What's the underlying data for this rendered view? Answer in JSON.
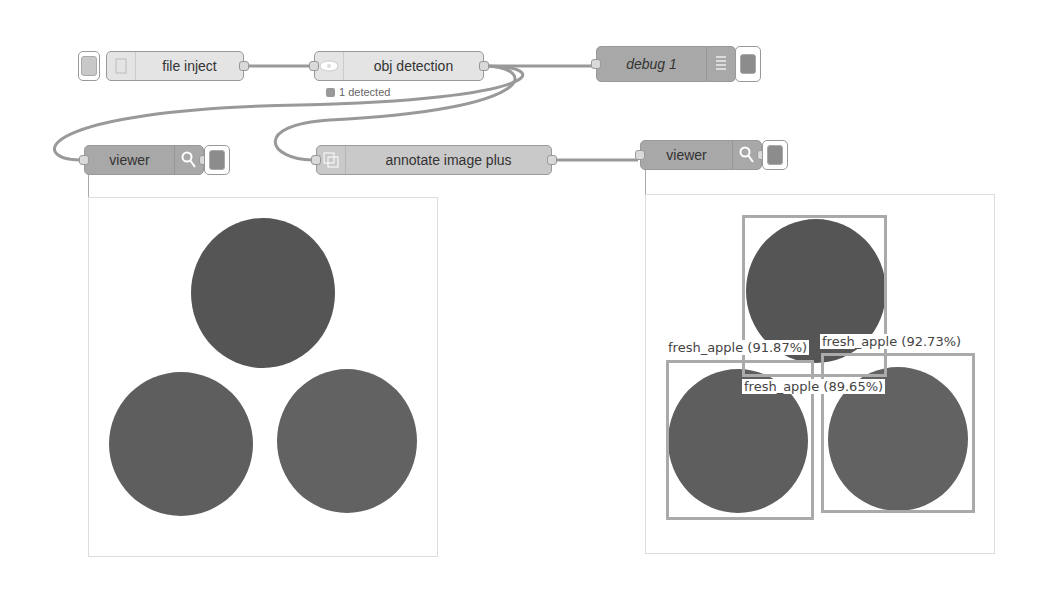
{
  "flow": {
    "nodes": {
      "file_inject": {
        "label": "file inject"
      },
      "obj_detection": {
        "label": "obj detection",
        "status": "1 detected"
      },
      "debug": {
        "label": "debug 1"
      },
      "viewer_left": {
        "label": "viewer"
      },
      "annotate": {
        "label": "annotate image plus"
      },
      "viewer_right": {
        "label": "viewer"
      }
    }
  },
  "annotations": [
    {
      "label": "fresh_apple (91.87%)"
    },
    {
      "label": "fresh_apple (92.73%)"
    },
    {
      "label": "fresh_apple (89.65%)"
    }
  ],
  "colors": {
    "node_light": "#e4e4e4",
    "node_dark": "#a8a8a8",
    "wire": "#999999",
    "bbox": "#aaaaaa"
  }
}
